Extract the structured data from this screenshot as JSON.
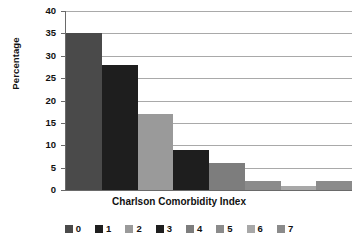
{
  "chart_data": {
    "type": "bar",
    "title": "",
    "subtitle": "",
    "xlabel": "Charlson Comorbidity Index",
    "ylabel": "Percentage",
    "categories": [
      "0",
      "1",
      "2",
      "3",
      "4",
      "5",
      "6",
      "7"
    ],
    "values": [
      35,
      28,
      17,
      9,
      6,
      2,
      1,
      2
    ],
    "ylim": [
      0,
      40
    ],
    "yticks": [
      0,
      5,
      10,
      15,
      20,
      25,
      30,
      35,
      40
    ],
    "ytick_labels": [
      "0",
      "5",
      "10",
      "15",
      "20",
      "25",
      "30",
      "35",
      "40"
    ],
    "grid": "horizontal",
    "legend_position": "bottom",
    "legend_entries": [
      {
        "label": "0",
        "color": "#4a4a4a"
      },
      {
        "label": "1",
        "color": "#1e1e1e"
      },
      {
        "label": "2",
        "color": "#9a9a9a"
      },
      {
        "label": "3",
        "color": "#1e1e1e"
      },
      {
        "label": "4",
        "color": "#7d7d7d"
      },
      {
        "label": "5",
        "color": "#8b8b8b"
      },
      {
        "label": "6",
        "color": "#a8a8a8"
      },
      {
        "label": "7",
        "color": "#8b8b8b"
      }
    ],
    "bar_colors": [
      "#4a4a4a",
      "#1e1e1e",
      "#9a9a9a",
      "#1e1e1e",
      "#7d7d7d",
      "#8b8b8b",
      "#a8a8a8",
      "#8b8b8b"
    ],
    "axis_color": "#6a6a6a",
    "grid_color": "#a9a9a9"
  }
}
